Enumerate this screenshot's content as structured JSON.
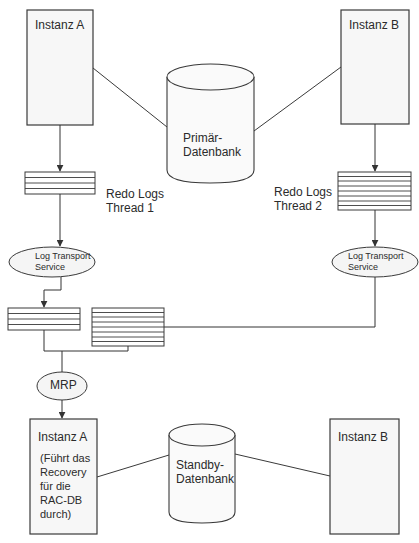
{
  "diagram": {
    "primary_site": {
      "instance_a": {
        "label": "Instanz A"
      },
      "instance_b": {
        "label": "Instanz B"
      },
      "database": {
        "label": "Primär-\nDatenbank"
      },
      "redo_logs_1": {
        "label": "Redo Logs\nThread 1"
      },
      "redo_logs_2": {
        "label": "Redo Logs\nThread 2"
      },
      "log_transport_1": {
        "label": "Log Transport\nService"
      },
      "log_transport_2": {
        "label": "Log Transport\nService"
      }
    },
    "standby_site": {
      "mrp": {
        "label": "MRP"
      },
      "instance_a": {
        "label": "Instanz A",
        "note": "(Führt das\nRecovery\nfür die\nRAC-DB\ndurch)"
      },
      "instance_b": {
        "label": "Instanz B"
      },
      "database": {
        "label": "Standby-\nDatenbank"
      }
    },
    "colors": {
      "stroke": "#3a3a3a",
      "fill": "#f7f7f7",
      "text": "#2b2b2b"
    }
  }
}
